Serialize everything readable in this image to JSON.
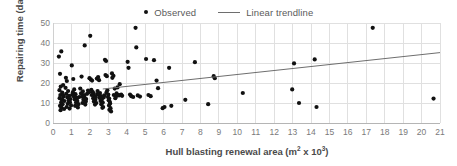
{
  "chart_data": {
    "type": "scatter",
    "title": "",
    "xlabel": "Hull blasting renewal area (m² x 10³)",
    "xlabel_parts": {
      "before": "Hull blasting renewal area (m",
      "sup1": "2",
      "middle": " x 10",
      "sup2": "3",
      "after": ")"
    },
    "ylabel": "Repairing time (day)",
    "xlim": [
      0,
      21
    ],
    "ylim": [
      0,
      50
    ],
    "xticks": [
      0,
      1,
      2,
      3,
      4,
      5,
      6,
      7,
      8,
      9,
      10,
      11,
      12,
      13,
      14,
      15,
      16,
      17,
      18,
      19,
      20,
      21
    ],
    "yticks": [
      0,
      10,
      20,
      30,
      40,
      50
    ],
    "grid": true,
    "grid_color": "#e0e0e0",
    "legend_position": "top-center",
    "marker_color": "#111111",
    "trendline_color": "#6e6e6e",
    "legend": [
      {
        "label": "Observed",
        "marker": "dot",
        "color": "#111111"
      },
      {
        "label": "Linear trendline",
        "marker": "line",
        "color": "#6e6e6e"
      }
    ],
    "series": [
      {
        "name": "Observed",
        "type": "scatter",
        "points": [
          [
            0.32,
            33.2
          ],
          [
            0.45,
            35.8
          ],
          [
            0.38,
            24.6
          ],
          [
            0.55,
            19.0
          ],
          [
            0.42,
            18.2
          ],
          [
            0.35,
            16.4
          ],
          [
            0.5,
            15.2
          ],
          [
            0.4,
            14.0
          ],
          [
            0.58,
            13.2
          ],
          [
            0.36,
            12.4
          ],
          [
            0.48,
            11.6
          ],
          [
            0.62,
            11.0
          ],
          [
            0.44,
            10.2
          ],
          [
            0.52,
            9.4
          ],
          [
            0.38,
            8.6
          ],
          [
            0.46,
            7.8
          ],
          [
            0.6,
            7.0
          ],
          [
            0.41,
            6.4
          ],
          [
            0.55,
            13.8
          ],
          [
            0.49,
            12.0
          ],
          [
            0.7,
            22.6
          ],
          [
            0.75,
            21.0
          ],
          [
            0.68,
            17.6
          ],
          [
            0.82,
            16.0
          ],
          [
            0.72,
            14.6
          ],
          [
            0.88,
            13.6
          ],
          [
            0.78,
            12.8
          ],
          [
            0.95,
            12.0
          ],
          [
            0.85,
            11.2
          ],
          [
            0.92,
            10.4
          ],
          [
            0.8,
            9.6
          ],
          [
            0.98,
            8.8
          ],
          [
            0.74,
            8.0
          ],
          [
            0.9,
            7.2
          ],
          [
            1.05,
            14.2
          ],
          [
            1.02,
            28.8
          ],
          [
            1.1,
            22.0
          ],
          [
            1.15,
            16.8
          ],
          [
            1.08,
            15.4
          ],
          [
            1.22,
            14.4
          ],
          [
            1.12,
            13.4
          ],
          [
            1.28,
            12.6
          ],
          [
            1.18,
            11.8
          ],
          [
            1.32,
            11.0
          ],
          [
            1.25,
            10.2
          ],
          [
            1.38,
            9.4
          ],
          [
            1.2,
            8.6
          ],
          [
            1.35,
            7.8
          ],
          [
            1.42,
            13.0
          ],
          [
            1.3,
            12.2
          ],
          [
            1.55,
            23.2
          ],
          [
            1.48,
            17.2
          ],
          [
            1.62,
            15.8
          ],
          [
            1.52,
            14.8
          ],
          [
            1.68,
            14.0
          ],
          [
            1.58,
            13.2
          ],
          [
            1.72,
            12.4
          ],
          [
            1.65,
            11.6
          ],
          [
            1.78,
            10.8
          ],
          [
            1.6,
            10.0
          ],
          [
            1.75,
            9.2
          ],
          [
            1.85,
            14.6
          ],
          [
            1.7,
            13.6
          ],
          [
            1.8,
            12.0
          ],
          [
            1.72,
            38.8
          ],
          [
            1.9,
            16.2
          ],
          [
            1.95,
            15.4
          ],
          [
            2.02,
            43.6
          ],
          [
            1.98,
            22.4
          ],
          [
            2.05,
            21.8
          ],
          [
            2.12,
            21.2
          ],
          [
            2.08,
            16.6
          ],
          [
            2.15,
            15.6
          ],
          [
            2.2,
            14.8
          ],
          [
            2.1,
            14.0
          ],
          [
            2.25,
            13.2
          ],
          [
            2.18,
            12.4
          ],
          [
            2.3,
            11.6
          ],
          [
            2.22,
            10.8
          ],
          [
            2.35,
            10.0
          ],
          [
            2.28,
            9.2
          ],
          [
            2.4,
            14.4
          ],
          [
            2.32,
            13.0
          ],
          [
            2.45,
            23.0
          ],
          [
            2.38,
            22.2
          ],
          [
            2.5,
            21.4
          ],
          [
            2.42,
            16.0
          ],
          [
            2.55,
            15.0
          ],
          [
            2.48,
            14.2
          ],
          [
            2.6,
            13.4
          ],
          [
            2.52,
            12.6
          ],
          [
            2.65,
            11.8
          ],
          [
            2.58,
            11.0
          ],
          [
            2.7,
            10.2
          ],
          [
            2.62,
            9.4
          ],
          [
            2.72,
            8.0
          ],
          [
            2.68,
            7.6
          ],
          [
            2.78,
            13.8
          ],
          [
            2.75,
            12.8
          ],
          [
            2.82,
            31.6
          ],
          [
            2.88,
            31.0
          ],
          [
            2.85,
            24.0
          ],
          [
            2.92,
            23.4
          ],
          [
            2.95,
            16.4
          ],
          [
            2.9,
            15.2
          ],
          [
            3.0,
            14.2
          ],
          [
            2.98,
            13.0
          ],
          [
            3.05,
            12.2
          ],
          [
            3.02,
            11.4
          ],
          [
            3.08,
            10.6
          ],
          [
            3.1,
            9.8
          ],
          [
            3.04,
            8.8
          ],
          [
            3.12,
            7.4
          ],
          [
            3.06,
            6.6
          ],
          [
            3.15,
            5.8
          ],
          [
            3.2,
            24.8
          ],
          [
            3.28,
            23.6
          ],
          [
            3.22,
            22.6
          ],
          [
            3.35,
            17.2
          ],
          [
            3.3,
            14.0
          ],
          [
            3.42,
            13.2
          ],
          [
            3.38,
            12.4
          ],
          [
            3.5,
            17.8
          ],
          [
            3.45,
            14.8
          ],
          [
            3.55,
            14.0
          ],
          [
            3.62,
            19.4
          ],
          [
            3.58,
            13.8
          ],
          [
            3.7,
            14.2
          ],
          [
            3.75,
            13.6
          ],
          [
            4.05,
            30.6
          ],
          [
            4.1,
            27.6
          ],
          [
            4.18,
            14.2
          ],
          [
            4.25,
            13.4
          ],
          [
            4.35,
            13.0
          ],
          [
            4.48,
            47.6
          ],
          [
            4.52,
            37.8
          ],
          [
            4.6,
            13.8
          ],
          [
            4.72,
            13.2
          ],
          [
            5.05,
            32.0
          ],
          [
            5.18,
            14.0
          ],
          [
            5.3,
            13.4
          ],
          [
            5.48,
            31.4
          ],
          [
            5.62,
            21.2
          ],
          [
            5.7,
            17.4
          ],
          [
            5.95,
            7.4
          ],
          [
            6.05,
            8.0
          ],
          [
            6.3,
            27.6
          ],
          [
            6.42,
            8.6
          ],
          [
            7.18,
            11.6
          ],
          [
            7.7,
            30.4
          ],
          [
            8.42,
            9.4
          ],
          [
            8.72,
            23.4
          ],
          [
            8.78,
            22.4
          ],
          [
            10.3,
            15.0
          ],
          [
            12.98,
            16.8
          ],
          [
            13.08,
            29.8
          ],
          [
            13.35,
            10.0
          ],
          [
            14.2,
            31.8
          ],
          [
            14.3,
            8.0
          ],
          [
            17.35,
            47.6
          ],
          [
            20.65,
            12.2
          ]
        ]
      },
      {
        "name": "Linear trendline",
        "type": "line",
        "points": [
          [
            2.7,
            17.0
          ],
          [
            21.0,
            35.2
          ]
        ]
      }
    ]
  }
}
